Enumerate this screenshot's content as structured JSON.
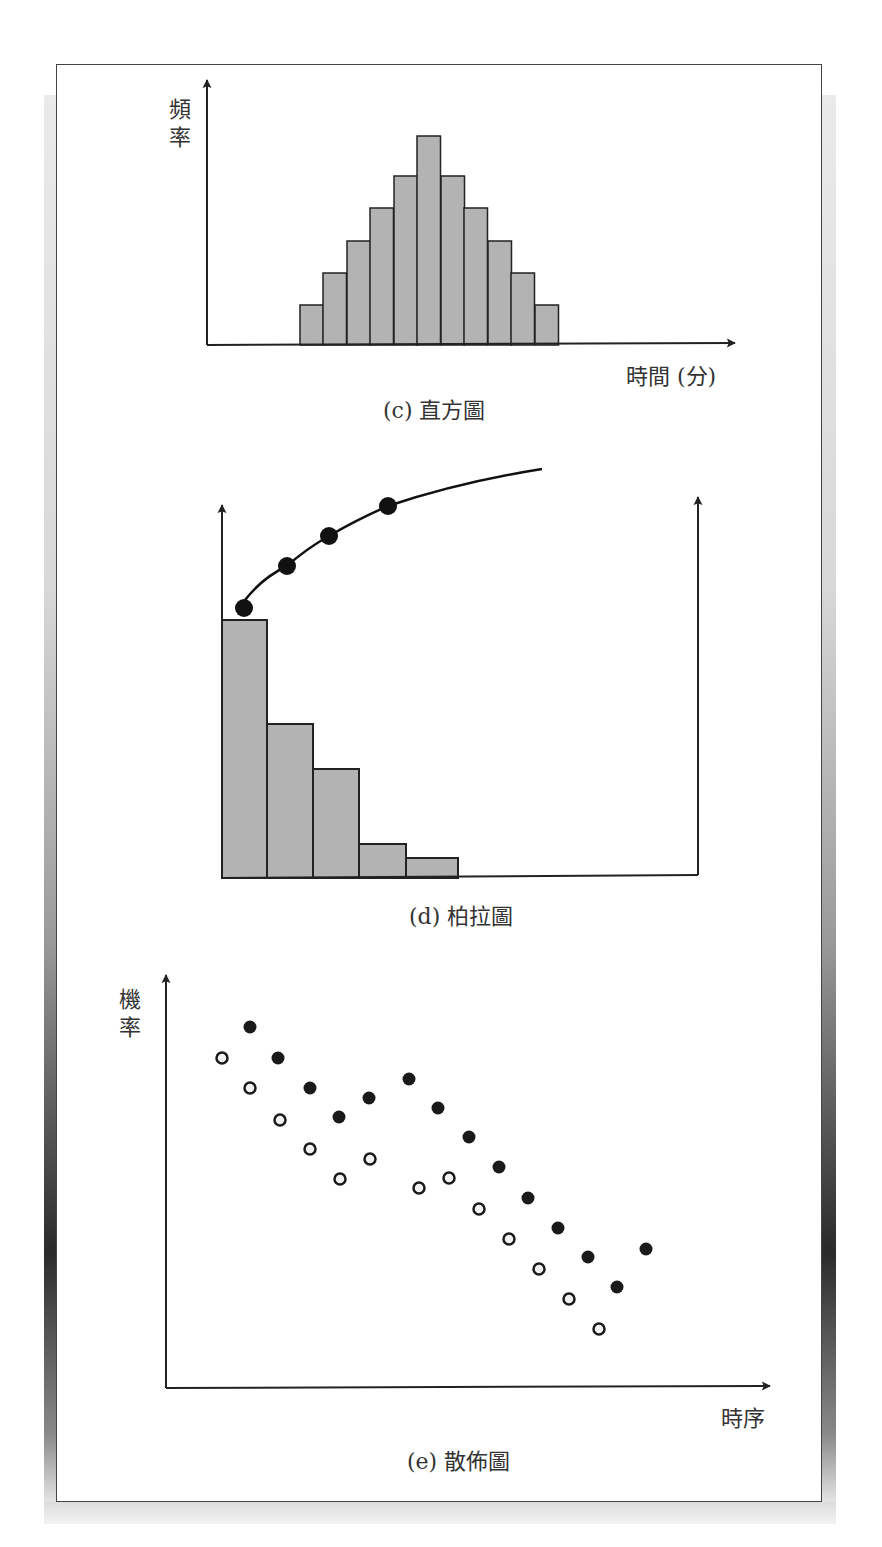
{
  "chart_data": [
    {
      "type": "bar",
      "subtype": "histogram",
      "title": "(c) 直方圖",
      "xlabel": "時間 (分)",
      "ylabel": "頻率",
      "categories": [
        "1",
        "2",
        "3",
        "4",
        "5",
        "6",
        "7",
        "8",
        "9",
        "10",
        "11"
      ],
      "values": [
        1,
        2,
        3,
        4,
        5,
        6.2,
        5,
        4,
        3,
        2,
        1.2
      ],
      "grid": false,
      "legend": null,
      "colors": {
        "bar_fill": "#b3b3b3",
        "bar_stroke": "#222222"
      }
    },
    {
      "type": "bar",
      "subtype": "pareto",
      "title": "(d) 柏拉圖",
      "xlabel": "",
      "ylabel": "",
      "categories": [
        "A",
        "B",
        "C",
        "D",
        "E"
      ],
      "values": [
        100,
        60,
        43,
        13,
        8
      ],
      "cumulative_line": {
        "type": "line",
        "points": [
          [
            1,
            100
          ],
          [
            2,
            116
          ],
          [
            3,
            128
          ],
          [
            4,
            140
          ]
        ],
        "extends_to": [
          7,
          153
        ]
      },
      "grid": false,
      "legend": null,
      "colors": {
        "bar_fill": "#b3b3b3",
        "bar_stroke": "#222222",
        "marker": "#111111"
      }
    },
    {
      "type": "scatter",
      "title": "(e) 散佈圖",
      "xlabel": "時序",
      "ylabel": "機率",
      "series": [
        {
          "name": "filled",
          "marker": "filled-circle",
          "points": [
            [
              250,
              1027
            ],
            [
              278,
              1058
            ],
            [
              310,
              1088
            ],
            [
              339,
              1117
            ],
            [
              369,
              1098
            ],
            [
              409,
              1079
            ],
            [
              438,
              1108
            ],
            [
              469,
              1137
            ],
            [
              499,
              1167
            ],
            [
              528,
              1198
            ],
            [
              558,
              1228
            ],
            [
              588,
              1257
            ],
            [
              617,
              1287
            ],
            [
              646,
              1249
            ]
          ]
        },
        {
          "name": "open",
          "marker": "open-circle",
          "points": [
            [
              222,
              1058
            ],
            [
              250,
              1088
            ],
            [
              280,
              1120
            ],
            [
              310,
              1149
            ],
            [
              340,
              1179
            ],
            [
              370,
              1159
            ],
            [
              419,
              1188
            ],
            [
              449,
              1178
            ],
            [
              479,
              1209
            ],
            [
              509,
              1239
            ],
            [
              539,
              1269
            ],
            [
              569,
              1299
            ],
            [
              599,
              1329
            ]
          ]
        }
      ],
      "note": "points given in pixel coordinates; y decreases with time (negative trend)",
      "grid": false,
      "legend": null
    }
  ],
  "histogram": {
    "ylabel": "頻率",
    "xlabel": "時間 (分)",
    "caption": "(c) 直方圖",
    "axis": {
      "x0": 207,
      "y0": 345,
      "ytop": 80,
      "xend": 735
    },
    "bars": [
      {
        "x": 300,
        "top": 305
      },
      {
        "x": 323,
        "top": 273
      },
      {
        "x": 347,
        "top": 241
      },
      {
        "x": 370,
        "top": 208
      },
      {
        "x": 394,
        "top": 176
      },
      {
        "x": 417,
        "top": 136
      },
      {
        "x": 441,
        "top": 176
      },
      {
        "x": 464,
        "top": 208
      },
      {
        "x": 488,
        "top": 241
      },
      {
        "x": 511,
        "top": 273
      },
      {
        "x": 535,
        "top": 305
      }
    ],
    "bar_width": 23.5
  },
  "pareto": {
    "caption": "(d) 柏拉圖",
    "axis": {
      "left_x": 222,
      "right_x": 698,
      "y0": 878,
      "left_top": 505,
      "right_top": 497
    },
    "bars": [
      {
        "x": 222,
        "w": 45,
        "top": 620
      },
      {
        "x": 267,
        "w": 46,
        "top": 724
      },
      {
        "x": 313,
        "w": 46,
        "top": 769
      },
      {
        "x": 359,
        "w": 47,
        "top": 844
      },
      {
        "x": 406,
        "w": 52,
        "top": 858
      }
    ],
    "curve_path": "M 245 600 Q 262 578 287 566 Q 306 549 329 536 Q 356 520 388 506 Q 460 482 542 469",
    "markers": [
      [
        244,
        608
      ],
      [
        287,
        566
      ],
      [
        329,
        536
      ],
      [
        388,
        506
      ]
    ]
  },
  "scatter": {
    "ylabel": "機率",
    "xlabel": "時序",
    "caption": "(e) 散佈圖",
    "axis": {
      "x0": 166,
      "y0": 1388,
      "ytop": 975,
      "xend": 770
    }
  }
}
